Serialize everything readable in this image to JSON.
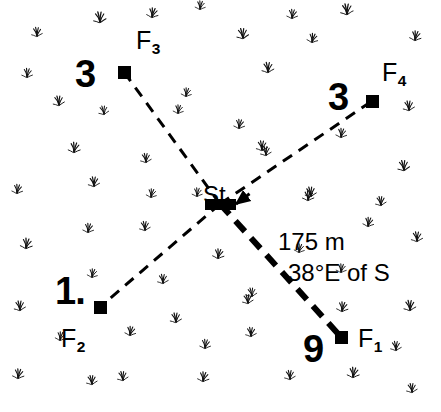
{
  "diagram": {
    "kind": "survey-traverse-sketch",
    "background_color": "#ffffff",
    "ink_color": "#000000",
    "canvas": {
      "width": 441,
      "height": 412
    },
    "station": {
      "id": "St",
      "label": "St",
      "label_x": 203,
      "label_y": 183,
      "marker": {
        "x": 205,
        "y": 199,
        "width": 31,
        "height": 11,
        "shape": "filled-rectangle"
      },
      "anchor": {
        "x": 220,
        "y": 204
      }
    },
    "flags": [
      {
        "id": "F1",
        "name": "F",
        "subscript": "1",
        "count_label": "9",
        "marker": {
          "x": 335,
          "y": 331,
          "size": 13,
          "shape": "filled-square"
        },
        "anchor": {
          "x": 341,
          "y": 337
        },
        "id_label_x": 358,
        "id_label_y": 326,
        "count_label_x": 303,
        "count_label_y": 330,
        "line_weight": "heavy",
        "line_width_px": 6,
        "dash_pattern": "14 9"
      },
      {
        "id": "F2",
        "name": "F",
        "subscript": "2",
        "count_label": "1.",
        "marker": {
          "x": 94,
          "y": 301,
          "size": 13,
          "shape": "filled-square"
        },
        "anchor": {
          "x": 100,
          "y": 307
        },
        "id_label_x": 61,
        "id_label_y": 326,
        "count_label_x": 55,
        "count_label_y": 272,
        "line_weight": "light",
        "line_width_px": 3,
        "dash_pattern": "11 8"
      },
      {
        "id": "F3",
        "name": "F",
        "subscript": "3",
        "count_label": "3",
        "marker": {
          "x": 118,
          "y": 66,
          "size": 13,
          "shape": "filled-square"
        },
        "anchor": {
          "x": 124,
          "y": 72
        },
        "id_label_x": 136,
        "id_label_y": 28,
        "count_label_x": 75,
        "count_label_y": 55,
        "line_weight": "light",
        "line_width_px": 3,
        "dash_pattern": "11 8"
      },
      {
        "id": "F4",
        "name": "F",
        "subscript": "4",
        "count_label": "3",
        "marker": {
          "x": 366,
          "y": 95,
          "size": 13,
          "shape": "filled-square"
        },
        "anchor": {
          "x": 372,
          "y": 101
        },
        "id_label_x": 382,
        "id_label_y": 60,
        "count_label_x": 328,
        "count_label_y": 78,
        "line_weight": "light",
        "line_width_px": 3,
        "dash_pattern": "11 8"
      }
    ],
    "arrowhead": {
      "description": "arrow pointing into station along the F4 bearing",
      "tip_x": 236,
      "tip_y": 204,
      "direction_deg": 200
    },
    "annotations": [
      {
        "id": "distance",
        "text": "175 m",
        "x": 278,
        "y": 230
      },
      {
        "id": "bearing",
        "text": "38°E of S",
        "x": 288,
        "y": 261
      }
    ],
    "vegetation": {
      "symbol_name": "grass-tuft",
      "count": 58,
      "tufts": [
        [
          100,
          22,
          1.0,
          -6
        ],
        [
          152,
          17,
          0.9,
          8
        ],
        [
          37,
          36,
          0.85,
          -3
        ],
        [
          200,
          9,
          0.8,
          5
        ],
        [
          243,
          38,
          0.95,
          -8
        ],
        [
          292,
          18,
          0.85,
          4
        ],
        [
          347,
          14,
          1.0,
          -5
        ],
        [
          415,
          40,
          0.9,
          7
        ],
        [
          27,
          77,
          0.85,
          3
        ],
        [
          59,
          105,
          0.9,
          -7
        ],
        [
          178,
          113,
          0.8,
          6
        ],
        [
          268,
          72,
          0.95,
          -4
        ],
        [
          312,
          42,
          0.85,
          9
        ],
        [
          409,
          110,
          0.9,
          -6
        ],
        [
          239,
          128,
          0.85,
          5
        ],
        [
          104,
          114,
          0.8,
          -9
        ],
        [
          74,
          152,
          0.95,
          4
        ],
        [
          146,
          162,
          0.85,
          -5
        ],
        [
          186,
          96,
          0.8,
          7
        ],
        [
          262,
          150,
          0.9,
          -3
        ],
        [
          341,
          137,
          0.85,
          6
        ],
        [
          404,
          170,
          0.95,
          -8
        ],
        [
          17,
          193,
          0.85,
          5
        ],
        [
          94,
          186,
          0.9,
          -4
        ],
        [
          151,
          197,
          0.8,
          8
        ],
        [
          266,
          155,
          0.85,
          -6
        ],
        [
          308,
          200,
          0.9,
          3
        ],
        [
          381,
          205,
          0.85,
          -7
        ],
        [
          26,
          248,
          0.95,
          6
        ],
        [
          145,
          230,
          0.85,
          -5
        ],
        [
          197,
          196,
          0.8,
          4
        ],
        [
          311,
          196,
          0.9,
          -8
        ],
        [
          368,
          226,
          0.85,
          7
        ],
        [
          417,
          241,
          0.9,
          -3
        ],
        [
          88,
          232,
          0.85,
          5
        ],
        [
          20,
          310,
          0.9,
          -6
        ],
        [
          92,
          277,
          0.8,
          8
        ],
        [
          163,
          283,
          0.85,
          -4
        ],
        [
          218,
          258,
          0.9,
          6
        ],
        [
          248,
          303,
          0.85,
          -7
        ],
        [
          341,
          272,
          0.8,
          5
        ],
        [
          410,
          310,
          0.95,
          -5
        ],
        [
          130,
          335,
          0.85,
          7
        ],
        [
          176,
          322,
          0.9,
          -6
        ],
        [
          205,
          348,
          0.85,
          4
        ],
        [
          252,
          296,
          0.8,
          -8
        ],
        [
          342,
          311,
          0.9,
          6
        ],
        [
          396,
          350,
          0.85,
          -4
        ],
        [
          18,
          378,
          0.9,
          5
        ],
        [
          92,
          384,
          0.85,
          -7
        ],
        [
          203,
          381,
          0.9,
          6
        ],
        [
          290,
          379,
          0.85,
          -5
        ],
        [
          353,
          377,
          0.95,
          4
        ],
        [
          412,
          392,
          0.85,
          -6
        ],
        [
          60,
          340,
          0.8,
          8
        ],
        [
          251,
          336,
          0.85,
          -3
        ],
        [
          299,
          252,
          0.8,
          7
        ],
        [
          123,
          380,
          0.85,
          -8
        ]
      ]
    }
  }
}
